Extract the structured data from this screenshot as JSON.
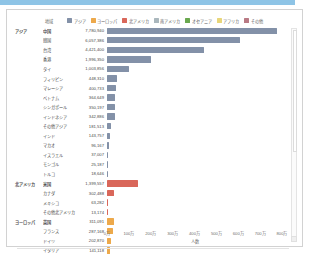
{
  "legend": {
    "title": "地域",
    "items": [
      {
        "label": "アジア",
        "color": "#8391a8"
      },
      {
        "label": "ヨーロッパ",
        "color": "#eda94b"
      },
      {
        "label": "北アメリカ",
        "color": "#d9675a"
      },
      {
        "label": "南アメリカ",
        "color": "#aab7bd"
      },
      {
        "label": "オセアニア",
        "color": "#6aa84f"
      },
      {
        "label": "アフリカ",
        "color": "#e8d67a"
      },
      {
        "label": "その他",
        "color": "#b97a84"
      }
    ]
  },
  "chart_data": {
    "type": "bar",
    "orientation": "horizontal",
    "title": "",
    "xlabel": "人数",
    "ylabel": "",
    "xlim": [
      0,
      8000000
    ],
    "xticks": [
      "0万",
      "100万",
      "200万",
      "300万",
      "400万",
      "500万",
      "600万",
      "700万",
      "800万"
    ],
    "xtick_values": [
      0,
      1000000,
      2000000,
      3000000,
      4000000,
      5000000,
      6000000,
      7000000,
      8000000
    ],
    "grid": false,
    "legend_position": "top",
    "groups": [
      {
        "region": "アジア",
        "color": "#8391a8",
        "rows": [
          {
            "name": "中国",
            "value": 7780940,
            "display": "7,780,940"
          },
          {
            "name": "韓国",
            "value": 6057386,
            "display": "6,057,386"
          },
          {
            "name": "台湾",
            "value": 4421400,
            "display": "4,421,400"
          },
          {
            "name": "香港",
            "value": 1996350,
            "display": "1,996,350"
          },
          {
            "name": "タイ",
            "value": 1003856,
            "display": "1,003,856"
          },
          {
            "name": "フィリピン",
            "value": 448310,
            "display": "448,310"
          },
          {
            "name": "マレーシア",
            "value": 400733,
            "display": "400,733"
          },
          {
            "name": "ベトナム",
            "value": 364649,
            "display": "364,649"
          },
          {
            "name": "シンガポール",
            "value": 350197,
            "display": "350,197"
          },
          {
            "name": "インドネシア",
            "value": 342886,
            "display": "342,886"
          },
          {
            "name": "その他アジア",
            "value": 181513,
            "display": "181,513"
          },
          {
            "name": "インド",
            "value": 143757,
            "display": "143,757"
          },
          {
            "name": "マカオ",
            "value": 96167,
            "display": "96,167"
          },
          {
            "name": "イスラエル",
            "value": 37007,
            "display": "37,007"
          },
          {
            "name": "モンゴル",
            "value": 25187,
            "display": "25,187"
          },
          {
            "name": "トルコ",
            "value": 18646,
            "display": "18,646"
          }
        ]
      },
      {
        "region": "北アメリカ",
        "color": "#d9675a",
        "rows": [
          {
            "name": "米国",
            "value": 1399557,
            "display": "1,399,557"
          },
          {
            "name": "カナダ",
            "value": 302488,
            "display": "302,488"
          },
          {
            "name": "メキシコ",
            "value": 63282,
            "display": "63,282"
          },
          {
            "name": "その他北アメリカ",
            "value": 13174,
            "display": "13,174"
          }
        ]
      },
      {
        "region": "ヨーロッパ",
        "color": "#eda94b",
        "rows": [
          {
            "name": "英国",
            "value": 311091,
            "display": "311,091"
          },
          {
            "name": "フランス",
            "value": 287168,
            "display": "287,168"
          },
          {
            "name": "ドイツ",
            "value": 202870,
            "display": "202,870"
          },
          {
            "name": "イタリア",
            "value": 141118,
            "display": "141,118"
          }
        ]
      }
    ]
  },
  "scrollbar": {
    "present": true
  }
}
